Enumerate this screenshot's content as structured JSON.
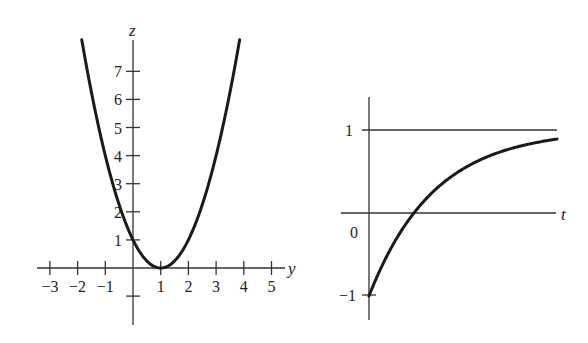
{
  "chart_data": [
    {
      "type": "line",
      "title": "",
      "xlabel": "y",
      "ylabel": "z",
      "function": "z = (y - 1)^2",
      "xlim": [
        -3,
        5
      ],
      "ylim": [
        -1,
        8
      ],
      "x_ticks": [
        -3,
        -2,
        -1,
        1,
        2,
        3,
        4,
        5
      ],
      "x_tick_labels": [
        "−3",
        "−2",
        "−1",
        "1",
        "2",
        "3",
        "4",
        "5"
      ],
      "y_ticks": [
        1,
        2,
        3,
        4,
        5,
        6,
        7
      ],
      "y_tick_labels": [
        "1",
        "2",
        "3",
        "4",
        "5",
        "6",
        "7"
      ],
      "extra_y_ticks": [
        -1
      ],
      "curve_domain": [
        -1.85,
        3.85
      ],
      "grid": false,
      "legend": "none"
    },
    {
      "type": "line",
      "title": "",
      "xlabel": "t",
      "ylabel": "",
      "function": "1 - 2 e^(-k t)",
      "initial_value": -1,
      "asymptote": 1,
      "end_value": 0.89,
      "y_ticks": [
        1,
        -1
      ],
      "y_tick_labels": [
        "1",
        "−1"
      ],
      "origin_label": "0",
      "grid": false,
      "legend": "none"
    }
  ]
}
